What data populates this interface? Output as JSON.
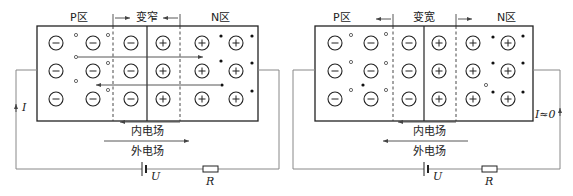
{
  "left_diagram": {
    "p_region_label": "P区",
    "depletion_label": "变窄",
    "n_region_label": "N区",
    "inner_field_label": "内电场",
    "outer_field_label": "外电场",
    "current_label": "I",
    "battery_label": "U",
    "resistor_label": "R",
    "depletion_change": "narrower",
    "outer_field_direction": "right",
    "inner_field_direction": "left"
  },
  "right_diagram": {
    "p_region_label": "P区",
    "depletion_label": "变宽",
    "n_region_label": "N区",
    "inner_field_label": "内电场",
    "outer_field_label": "外电场",
    "current_label": "I≈0",
    "battery_label": "U",
    "resistor_label": "R",
    "depletion_change": "wider",
    "outer_field_direction": "left",
    "inner_field_direction": "left"
  },
  "colors": {
    "line": "#222222",
    "wire": "#888888",
    "background": "#ffffff"
  }
}
